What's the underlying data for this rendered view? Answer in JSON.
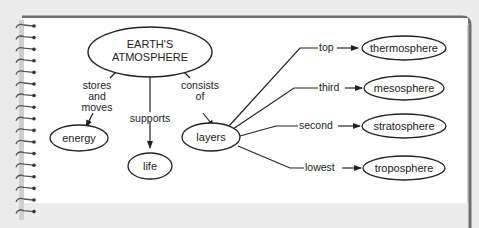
{
  "concept_map": {
    "root": "EARTH'S ATMOSPHERE",
    "root_lines": [
      "EARTH'S",
      "ATMOSPHERE"
    ],
    "links": {
      "stores_and_moves": [
        "stores",
        "and",
        "moves"
      ],
      "supports": "supports",
      "consists_of": [
        "consists",
        "of"
      ],
      "top": "top",
      "third": "third",
      "second": "second",
      "lowest": "lowest"
    },
    "nodes": {
      "energy": "energy",
      "life": "life",
      "layers": "layers",
      "thermosphere": "thermosphere",
      "mesosphere": "mesosphere",
      "stratosphere": "stratosphere",
      "troposphere": "troposphere"
    }
  },
  "colors": {
    "background": "#ececec",
    "page": "#ffffff",
    "frame": "#6e6e6e",
    "ink": "#222222"
  }
}
